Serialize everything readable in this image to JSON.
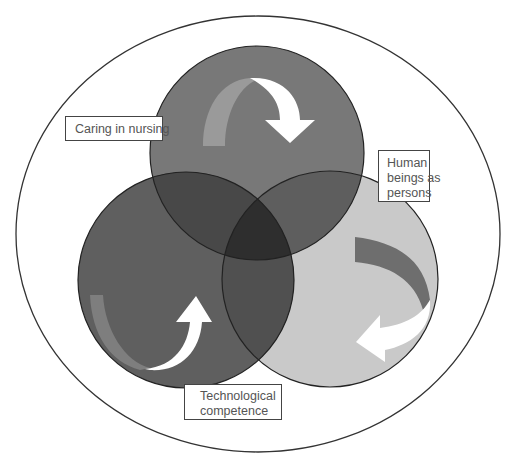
{
  "diagram": {
    "type": "venn",
    "outer_ellipse": {
      "cx": 258,
      "cy": 234,
      "rx": 242,
      "ry": 218,
      "stroke": "#333333"
    },
    "circles": [
      {
        "id": "caring",
        "cx": 257,
        "cy": 153,
        "r": 107,
        "fill": "#787878"
      },
      {
        "id": "technological",
        "cx": 186,
        "cy": 280,
        "r": 108,
        "fill": "#5f5f5f"
      },
      {
        "id": "human",
        "cx": 330,
        "cy": 279,
        "r": 108,
        "fill": "#c9c9c9"
      }
    ],
    "overlap_colors": {
      "caring_technological": "#484848",
      "caring_human": "#5e5e5e",
      "technological_human": "#505050",
      "center": "#2e2e2e"
    },
    "labels": {
      "caring": {
        "lines": [
          "Caring in nursing"
        ]
      },
      "human": {
        "lines": [
          "Human",
          "beings as",
          "persons"
        ]
      },
      "technological": {
        "lines": [
          "Technological",
          "competence"
        ]
      }
    },
    "arrows": [
      {
        "id": "arrow-caring",
        "direction": "clockwise-down"
      },
      {
        "id": "arrow-human",
        "direction": "clockwise-left"
      },
      {
        "id": "arrow-technological",
        "direction": "up-right"
      }
    ]
  }
}
